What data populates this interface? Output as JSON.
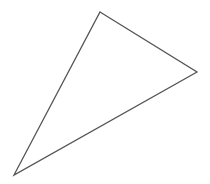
{
  "canvas": {
    "width": 210,
    "height": 184,
    "background_color": "#ffffff",
    "label": "triangle-drawing-canvas"
  },
  "shape": {
    "type": "triangle",
    "name": "scalene-triangle",
    "fill": "none",
    "fill_color": "#ffffff",
    "stroke_color": "#555555",
    "stroke_width": 1.3,
    "closed": true,
    "vertices": [
      {
        "name": "apex-top",
        "x": 100,
        "y": 12
      },
      {
        "name": "vertex-right",
        "x": 197,
        "y": 72
      },
      {
        "name": "vertex-bottom-left",
        "x": 14,
        "y": 175
      }
    ],
    "points_attr": "100,12 197,72 14,175",
    "edges": [
      {
        "name": "edge-top-right",
        "from": "apex-top",
        "to": "vertex-right"
      },
      {
        "name": "edge-bottom",
        "from": "vertex-right",
        "to": "vertex-bottom-left"
      },
      {
        "name": "edge-left",
        "from": "vertex-bottom-left",
        "to": "apex-top"
      }
    ]
  }
}
